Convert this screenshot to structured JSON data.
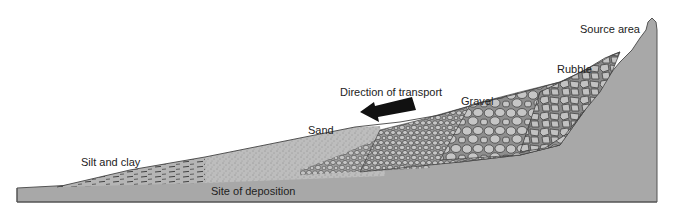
{
  "diagram": {
    "type": "geological-cross-section",
    "labels": {
      "source_area": "Source area",
      "rubble": "Rubble",
      "gravel": "Gravel",
      "sand": "Sand",
      "silt_and_clay": "Silt and clay",
      "site_of_deposition": "Site of deposition",
      "direction_of_transport": "Direction of transport"
    },
    "colors": {
      "bedrock": "#a8a8a8",
      "sediment": "#bdbdbd",
      "clast_fill": "#c4c4c4",
      "clast_outline": "#3a3a3a",
      "arrow": "#111111",
      "text": "#222222"
    },
    "sequence": [
      "Rubble",
      "Gravel",
      "Sand",
      "Silt and clay"
    ]
  }
}
